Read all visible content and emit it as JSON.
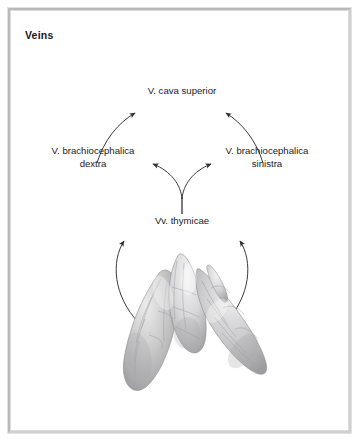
{
  "panel": {
    "title": "Veins",
    "border_color": "#b9b9b9",
    "background_color": "#ffffff"
  },
  "diagram": {
    "type": "anatomical-flow-diagram",
    "text_color": "#1b1b1b",
    "arrow_color": "#3a3a3a",
    "nodes": [
      {
        "id": "cava",
        "label": "V. cava superior"
      },
      {
        "id": "dextra",
        "label_line1": "V. brachiocephalica",
        "label_line2": "dextra"
      },
      {
        "id": "sinistra",
        "label_line1": "V. brachiocephalica",
        "label_line2": "sinistra"
      },
      {
        "id": "thymicae",
        "label": "Vv. thymicae"
      }
    ],
    "flow": [
      {
        "from": "dextra",
        "to": "cava"
      },
      {
        "from": "sinistra",
        "to": "cava"
      },
      {
        "from": "thymicae",
        "to": "dextra"
      },
      {
        "from": "thymicae",
        "to": "sinistra"
      },
      {
        "from": "thymus-image",
        "to": "thymicae-left"
      },
      {
        "from": "thymus-image",
        "to": "thymicae-right"
      }
    ]
  },
  "specimen": {
    "name": "thymus-specimen",
    "description": "Thymus gland, two lobes",
    "tone_light": "#e6e6e6",
    "tone_mid": "#bdbdbd",
    "tone_dark": "#8e8e8e"
  }
}
